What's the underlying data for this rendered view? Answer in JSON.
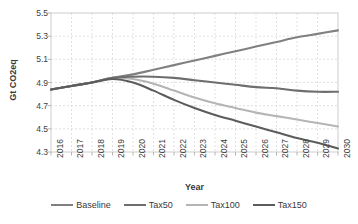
{
  "chart_data": {
    "type": "line",
    "title": "",
    "xlabel": "Year",
    "ylabel": "Gt CO2eq",
    "xlim": [
      2016,
      2030
    ],
    "ylim": [
      4.3,
      5.5
    ],
    "yticks": [
      "4.3",
      "4.5",
      "4.7",
      "4.9",
      "5.1",
      "5.3",
      "5.5"
    ],
    "grid": true,
    "legend_position": "bottom",
    "categories": [
      2016,
      2017,
      2018,
      2019,
      2020,
      2021,
      2022,
      2023,
      2024,
      2025,
      2026,
      2027,
      2028,
      2029,
      2030
    ],
    "xtick_labels": [
      "2016",
      "2017",
      "2018",
      "2019",
      "2020",
      "2021",
      "2022",
      "2023",
      "2024",
      "2025",
      "2026",
      "2027",
      "2028",
      "2029",
      "2030"
    ],
    "series": [
      {
        "name": "Baseline",
        "color": "#808080",
        "values": [
          4.84,
          4.87,
          4.9,
          4.94,
          4.97,
          5.01,
          5.05,
          5.09,
          5.13,
          5.17,
          5.21,
          5.25,
          5.29,
          5.32,
          5.35
        ]
      },
      {
        "name": "Tax50",
        "color": "#6e6e6e",
        "values": [
          4.84,
          4.87,
          4.9,
          4.94,
          4.95,
          4.95,
          4.94,
          4.92,
          4.9,
          4.88,
          4.86,
          4.85,
          4.83,
          4.82,
          4.82
        ]
      },
      {
        "name": "Tax100",
        "color": "#b5b5b5",
        "values": [
          4.84,
          4.87,
          4.9,
          4.94,
          4.93,
          4.89,
          4.83,
          4.77,
          4.72,
          4.68,
          4.64,
          4.61,
          4.58,
          4.55,
          4.52
        ]
      },
      {
        "name": "Tax150",
        "color": "#5c5c5c",
        "values": [
          4.84,
          4.87,
          4.9,
          4.93,
          4.9,
          4.83,
          4.75,
          4.68,
          4.62,
          4.57,
          4.52,
          4.47,
          4.42,
          4.38,
          4.33
        ]
      }
    ]
  },
  "legend": {
    "items": [
      {
        "label": "Baseline"
      },
      {
        "label": "Tax50"
      },
      {
        "label": "Tax100"
      },
      {
        "label": "Tax150"
      }
    ]
  },
  "axes": {
    "y_title": "Gt CO2eq",
    "x_title": "Year"
  },
  "colors": {
    "plot_border": "#c8c8c8",
    "gridline": "#d9d9d9",
    "axis_line": "#a6a6a6",
    "text": "#404040"
  }
}
